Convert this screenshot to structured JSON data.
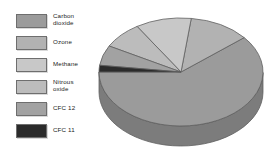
{
  "figure": {
    "background": "#ffffff",
    "width": 279,
    "height": 148
  },
  "legend": {
    "name": "gas-legend",
    "position": "left",
    "items": [
      {
        "label": "Carbon\ndioxide",
        "plain": "Carbon dioxide",
        "color": "#9b9b9b",
        "swatch_name": "swatch-carbon-dioxide"
      },
      {
        "label": "Ozone",
        "plain": "Ozone",
        "color": "#b2b2b2",
        "swatch_name": "swatch-ozone"
      },
      {
        "label": "Methane",
        "plain": "Methane",
        "color": "#c8c8c8",
        "swatch_name": "swatch-methane"
      },
      {
        "label": "Nitrous\noxide",
        "plain": "Nitrous oxide",
        "color": "#bcbcbc",
        "swatch_name": "swatch-nitrous-oxide"
      },
      {
        "label": "CFC 12",
        "plain": "CFC 12",
        "color": "#a2a2a2",
        "swatch_name": "swatch-cfc-12"
      },
      {
        "label": "CFC 11",
        "plain": "CFC 11",
        "color": "#2b2b2b",
        "swatch_name": "swatch-cfc-11"
      }
    ]
  },
  "chart_data": {
    "type": "pie",
    "title": "",
    "subtitle": "",
    "xlabel": "",
    "ylabel": "",
    "grid": false,
    "legend_position": "left",
    "three_d": true,
    "start_angle_deg": 180,
    "direction": "counterclockwise",
    "categories": [
      "Carbon dioxide",
      "Ozone",
      "Methane",
      "Nitrous oxide",
      "CFC 12",
      "CFC 11"
    ],
    "values": [
      61,
      12,
      11,
      8,
      6,
      2
    ],
    "units": "percent",
    "colors": [
      "#9b9b9b",
      "#b2b2b2",
      "#c8c8c8",
      "#bcbcbc",
      "#a2a2a2",
      "#2b2b2b"
    ],
    "series": [
      {
        "name": "Contribution to greenhouse effect",
        "values": [
          61,
          12,
          11,
          8,
          6,
          2
        ]
      }
    ],
    "annotations": []
  },
  "geometry": {
    "center_x": 85,
    "center_y": 72,
    "radius_x": 82,
    "radius_y": 54,
    "depth": 20,
    "edge_color": "#5f5f5f",
    "edge_width": 0.8
  }
}
